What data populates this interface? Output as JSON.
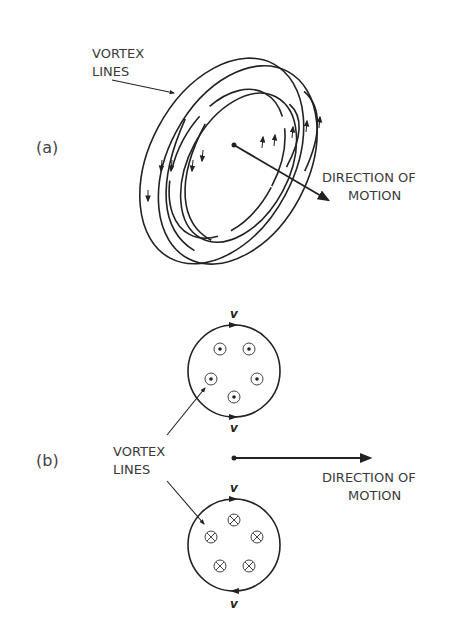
{
  "panel_a": {
    "label": "(a)",
    "vortex_label_line1": "VORTEX",
    "vortex_label_line2": "LINES",
    "direction_label_line1": "DIRECTION OF",
    "direction_label_line2": "MOTION"
  },
  "panel_b": {
    "label": "(b)",
    "vortex_label_line1": "VORTEX",
    "vortex_label_line2": "LINES",
    "direction_label_line1": "DIRECTION OF",
    "direction_label_line2": "MOTION",
    "velocity_symbol": "v",
    "top_circle": {
      "symbol": "dot-in-circle",
      "meaning": "vortex lines out of page",
      "count": 5
    },
    "bottom_circle": {
      "symbol": "cross-in-circle",
      "meaning": "vortex lines into page",
      "count": 5
    }
  },
  "colors": {
    "ink": "#222222",
    "text": "#3a3a3a",
    "background": "#ffffff"
  }
}
